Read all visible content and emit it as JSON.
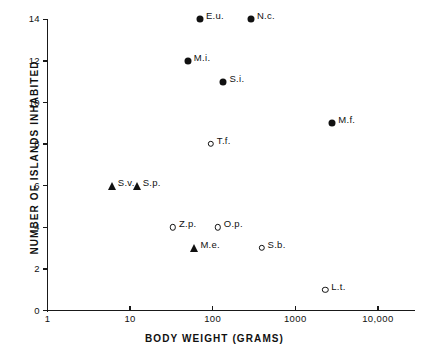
{
  "chart_data": {
    "type": "scatter",
    "title": "",
    "xlabel": "BODY WEIGHT (GRAMS)",
    "ylabel": "NUMBER OF ISLANDS INHABITED",
    "xscale": "log",
    "yscale": "linear",
    "xlim": [
      1,
      25000
    ],
    "ylim": [
      0,
      14.5
    ],
    "grid": false,
    "legend": "none",
    "xticks": [
      {
        "value": 1,
        "label": "1"
      },
      {
        "value": 10,
        "label": "10"
      },
      {
        "value": 100,
        "label": "100"
      },
      {
        "value": 1000,
        "label": "1000"
      },
      {
        "value": 10000,
        "label": "10,000"
      }
    ],
    "yticks": [
      {
        "value": 0,
        "label": "0"
      },
      {
        "value": 2,
        "label": "2"
      },
      {
        "value": 4,
        "label": "4"
      },
      {
        "value": 6,
        "label": "6"
      },
      {
        "value": 8,
        "label": "8"
      },
      {
        "value": 10,
        "label": "10"
      },
      {
        "value": 12,
        "label": "12"
      },
      {
        "value": 14,
        "label": "14"
      }
    ],
    "marker_types": [
      "filled-circle",
      "open-circle",
      "triangle"
    ],
    "points": [
      {
        "label": "E.u.",
        "x": 70,
        "y": 14,
        "marker": "filled-circle",
        "label_side": "right"
      },
      {
        "label": "N.c.",
        "x": 290,
        "y": 14,
        "marker": "filled-circle",
        "label_side": "right"
      },
      {
        "label": "M.i.",
        "x": 50,
        "y": 12,
        "marker": "filled-circle",
        "label_side": "right"
      },
      {
        "label": "S.i.",
        "x": 135,
        "y": 11,
        "marker": "filled-circle",
        "label_side": "right"
      },
      {
        "label": "M.f.",
        "x": 2800,
        "y": 9,
        "marker": "filled-circle",
        "label_side": "right"
      },
      {
        "label": "T.f.",
        "x": 95,
        "y": 8,
        "marker": "open-circle",
        "label_side": "right"
      },
      {
        "label": "S.v.",
        "x": 6,
        "y": 6,
        "marker": "triangle",
        "label_side": "right"
      },
      {
        "label": "S.p.",
        "x": 12,
        "y": 6,
        "marker": "triangle",
        "label_side": "right"
      },
      {
        "label": "Z.p.",
        "x": 33,
        "y": 4,
        "marker": "open-circle",
        "label_side": "right"
      },
      {
        "label": "O.p.",
        "x": 115,
        "y": 4,
        "marker": "open-circle",
        "label_side": "right"
      },
      {
        "label": "M.e.",
        "x": 60,
        "y": 3,
        "marker": "triangle",
        "label_side": "right"
      },
      {
        "label": "S.b.",
        "x": 390,
        "y": 3,
        "marker": "open-circle",
        "label_side": "right"
      },
      {
        "label": "L.t.",
        "x": 2300,
        "y": 1,
        "marker": "open-circle",
        "label_side": "right"
      }
    ]
  },
  "colors": {
    "ink": "#111111",
    "background": "#ffffff"
  }
}
